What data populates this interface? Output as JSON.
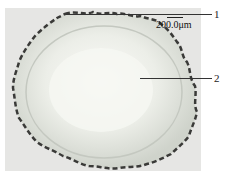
{
  "figure": {
    "type": "micrograph",
    "scale_bar": {
      "label": "200.0μm"
    },
    "annotations": [
      {
        "id": 1,
        "label": "1",
        "points_to": "outer crenulated layer"
      },
      {
        "id": 2,
        "label": "2",
        "points_to": "central pale tissue"
      }
    ],
    "colors": {
      "background": "#e6e6e4",
      "tissue": "#d9dcd6",
      "center": "#f4f5f2",
      "edge": "#3a3a38"
    }
  }
}
